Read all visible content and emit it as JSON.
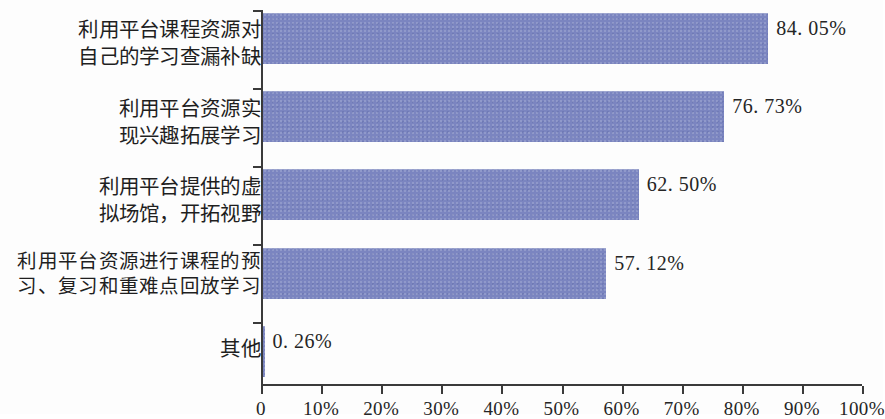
{
  "chart_data": {
    "type": "bar",
    "orientation": "horizontal",
    "title": "",
    "subtitle": "",
    "xlabel": "",
    "ylabel": "",
    "xlim": [
      0,
      100
    ],
    "grid": false,
    "legend": null,
    "bar_color": "#7b85c0",
    "axis_color": "#3a3a3a",
    "categories": [
      "利用平台课程资源对\n自己的学习查漏补缺",
      "利用平台资源实\n现兴趣拓展学习",
      "利用平台提供的虚\n拟场馆，开拓视野",
      "利用平台资源进行课程的预\n习、复习和重难点回放学习",
      "其他"
    ],
    "values": [
      84.05,
      76.73,
      62.5,
      57.12,
      0.26
    ],
    "value_labels": [
      "84. 05%",
      "76. 73%",
      "62. 50%",
      "57. 12%",
      "0. 26%"
    ],
    "xticks": [
      0,
      10,
      20,
      30,
      40,
      50,
      60,
      70,
      80,
      90,
      100
    ],
    "xtick_labels": [
      "0",
      "10%",
      "20%",
      "30%",
      "40%",
      "50%",
      "60%",
      "70%",
      "80%",
      "90%",
      "100%"
    ]
  }
}
